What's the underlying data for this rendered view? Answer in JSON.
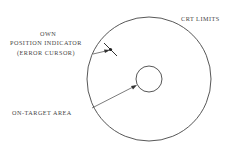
{
  "diagram": {
    "labels": {
      "own_line1": "OWN",
      "own_line2": "POSITION INDICATOR",
      "own_line3": "(ERROR CURSOR)",
      "crt_limits": "CRT LIMITS",
      "on_target": "ON-TARGET AREA"
    },
    "colors": {
      "line": "#444444",
      "background": "#ffffff"
    },
    "geometry": {
      "outer_circle": {
        "cx": 149,
        "cy": 79,
        "r": 62
      },
      "inner_circle": {
        "cx": 149,
        "cy": 79,
        "r": 13
      }
    }
  }
}
